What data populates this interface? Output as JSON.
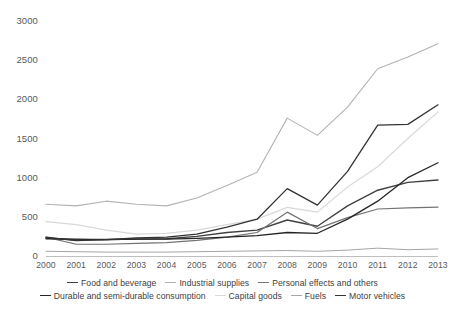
{
  "chart_data": {
    "type": "line",
    "title": "",
    "xlabel": "",
    "ylabel": "",
    "x": [
      2000,
      2001,
      2002,
      2003,
      2004,
      2005,
      2006,
      2007,
      2008,
      2009,
      2010,
      2011,
      2012,
      2013
    ],
    "categories": [
      "2000",
      "2001",
      "2002",
      "2003",
      "2004",
      "2005",
      "2006",
      "2007",
      "2008",
      "2009",
      "2010",
      "2011",
      "2012",
      "2013"
    ],
    "xlim": [
      2000,
      2013
    ],
    "ylim": [
      0,
      3000
    ],
    "yticks": [
      0,
      500,
      1000,
      1500,
      2000,
      2500,
      3000
    ],
    "ytick_labels": [
      "0",
      "500",
      "1000",
      "1500",
      "2000",
      "2500",
      "3000"
    ],
    "grid": false,
    "legend_position": "bottom",
    "series": [
      {
        "name": "Food and beverage",
        "color": "#404040",
        "width": 1.4,
        "values": [
          230,
          205,
          210,
          215,
          220,
          250,
          300,
          330,
          460,
          380,
          640,
          840,
          940,
          970
        ]
      },
      {
        "name": "Industrial supplies",
        "color": "#b3b3b3",
        "width": 1.1,
        "values": [
          660,
          640,
          700,
          660,
          640,
          740,
          900,
          1070,
          1760,
          1540,
          1900,
          2390,
          2540,
          2710
        ]
      },
      {
        "name": "Personal effects and others",
        "color": "#737373",
        "width": 1.2,
        "values": [
          240,
          150,
          150,
          160,
          170,
          200,
          240,
          300,
          560,
          350,
          490,
          600,
          615,
          625
        ]
      },
      {
        "name": "Durable and semi-durable consumption",
        "color": "#262626",
        "width": 1.3,
        "values": [
          220,
          215,
          210,
          215,
          215,
          225,
          240,
          260,
          300,
          290,
          470,
          700,
          1000,
          1190
        ]
      },
      {
        "name": "Capital goods",
        "color": "#d9d9d9",
        "width": 1.2,
        "values": [
          440,
          400,
          330,
          280,
          290,
          330,
          400,
          470,
          620,
          560,
          880,
          1140,
          1500,
          1840
        ]
      },
      {
        "name": "Fuels",
        "color": "#a6a6a6",
        "width": 1.0,
        "values": [
          60,
          55,
          50,
          50,
          50,
          55,
          60,
          65,
          70,
          60,
          75,
          100,
          80,
          90
        ]
      },
      {
        "name": "Motor vehicles",
        "color": "#333333",
        "width": 1.3,
        "values": [
          240,
          195,
          210,
          230,
          240,
          280,
          370,
          470,
          860,
          650,
          1080,
          1670,
          1680,
          1930
        ]
      }
    ]
  },
  "axes": {
    "y_labels": [
      "3000",
      "2500",
      "2000",
      "1500",
      "1000",
      "500",
      "0"
    ],
    "x_labels": [
      "2000",
      "2001",
      "2002",
      "2003",
      "2004",
      "2005",
      "2006",
      "2007",
      "2008",
      "2009",
      "2010",
      "2011",
      "2012",
      "2013"
    ]
  },
  "legend": {
    "row1": [
      {
        "label": "Food and beverage",
        "color": "#404040"
      },
      {
        "label": "Industrial supplies",
        "color": "#b3b3b3"
      },
      {
        "label": "Personal effects and others",
        "color": "#737373"
      }
    ],
    "row2": [
      {
        "label": "Durable and semi-durable consumption",
        "color": "#262626"
      },
      {
        "label": "Capital goods",
        "color": "#d9d9d9"
      },
      {
        "label": "Fuels",
        "color": "#a6a6a6"
      },
      {
        "label": "Motor vehicles",
        "color": "#333333"
      }
    ]
  }
}
